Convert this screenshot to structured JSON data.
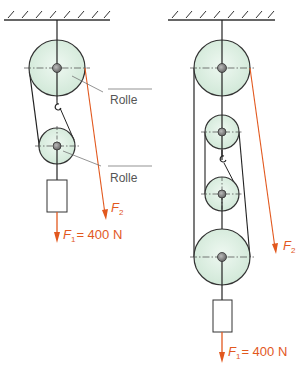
{
  "colors": {
    "rope": "#222222",
    "force": "#e2581e",
    "pulley_fill": "#dcefe2",
    "pulley_stroke": "#333333",
    "label": "#555555"
  },
  "left_system": {
    "labels": {
      "rolle_top": "Rolle",
      "rolle_bottom": "Rolle"
    },
    "forces": {
      "f2_symbol": "F",
      "f2_sub": "2",
      "f1_symbol": "F",
      "f1_sub": "1",
      "f1_value": "= 400 N"
    }
  },
  "right_system": {
    "forces": {
      "f2_symbol": "F",
      "f2_sub": "2",
      "f1_symbol": "F",
      "f1_sub": "1",
      "f1_value": "= 400 N"
    }
  }
}
